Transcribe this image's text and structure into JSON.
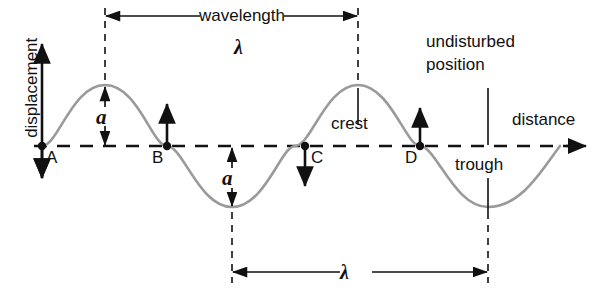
{
  "diagram": {
    "axes": {
      "y_axis_label": "displacement",
      "x_axis_label": "distance"
    },
    "labels": {
      "wavelength_word": "wavelength",
      "lambda_top": "λ",
      "lambda_bottom": "λ",
      "amplitude_top": "a",
      "amplitude_bottom": "a",
      "crest": "crest",
      "trough": "trough",
      "undisturbed_line1": "undisturbed",
      "undisturbed_line2": "position"
    },
    "points": [
      {
        "id": "A",
        "label": "A",
        "x": 42,
        "y": 146,
        "motion": "down"
      },
      {
        "id": "B",
        "label": "B",
        "x": 167,
        "y": 146,
        "motion": "up"
      },
      {
        "id": "C",
        "label": "C",
        "x": 305,
        "y": 146,
        "motion": "down"
      },
      {
        "id": "D",
        "label": "D",
        "x": 420,
        "y": 146,
        "motion": "up"
      }
    ],
    "colors": {
      "wave_curve": "#9a9a9a",
      "ink": "#111111",
      "background": "#ffffff"
    },
    "geometry": {
      "baseline_y": 146,
      "amplitude_px": 61,
      "wavelength_px": 253,
      "crest1_x": 105,
      "trough1_x": 232,
      "crest2_x": 358,
      "trough2_x": 488,
      "axis_arrow_end_x": 583
    }
  }
}
